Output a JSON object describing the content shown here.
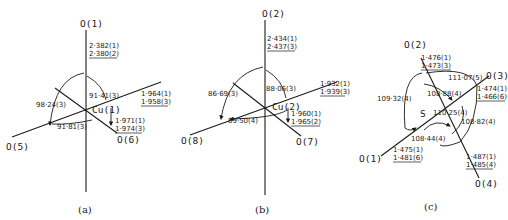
{
  "panels": [
    {
      "caption": "(a)",
      "center": "Cu(1)",
      "atoms": {
        "top": "O(1)",
        "left": "O(5)",
        "lower_right": "O(6)"
      },
      "distances": {
        "top": [
          "2·382(1)",
          "2·380(2)"
        ],
        "right": [
          "1·964(1)",
          "1·958(3)"
        ],
        "lower_right": [
          "1·971(1)",
          "1·974(3)"
        ]
      },
      "angles": {
        "left_arc": "98·24(3)",
        "top_right": "91·41(3)",
        "bottom": "91·81(3)"
      }
    },
    {
      "caption": "(b)",
      "center": "Cu(2)",
      "atoms": {
        "top": "O(2)",
        "left": "O(8)",
        "lower_right": "O(7)"
      },
      "distances": {
        "top": [
          "2·434(1)",
          "2·437(3)"
        ],
        "right": [
          "1·932(1)",
          "1·939(3)"
        ],
        "lower_right": [
          "1·960(1)",
          "1·965(2)"
        ]
      },
      "angles": {
        "left_arc": "86·69(3)",
        "top_right": "88·06(3)",
        "bottom": "89·50(4)"
      }
    },
    {
      "caption": "(c)",
      "center": "S",
      "atoms": {
        "top": "O(2)",
        "right": "O(3)",
        "left": "O(1)",
        "lower_right": "O(4)"
      },
      "distances": {
        "top": [
          "1·476(1)",
          "1·473(3)"
        ],
        "right": [
          "1·474(1)",
          "1·466(6)"
        ],
        "left": [
          "1·475(1)",
          "1·481(6)"
        ],
        "lower_right": [
          "1·487(1)",
          "1·485(4)"
        ]
      },
      "angles": {
        "top": "111·07(5)",
        "left": "109·32(4)",
        "inner_top": "108·88(4)",
        "inner_right": "110·25(4)",
        "right": "108·82(4)",
        "bottom": "108·44(4)"
      }
    }
  ]
}
